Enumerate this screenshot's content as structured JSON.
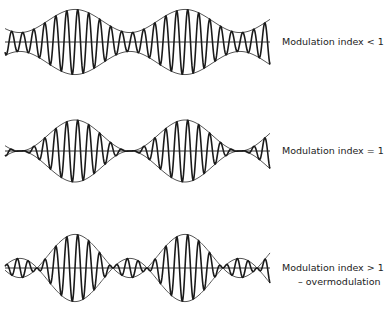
{
  "diagram": {
    "title": "",
    "panels": [
      {
        "id": "under",
        "label": "Modulation index < 1",
        "sublabel": "",
        "modulation_index": 0.55,
        "axis_y": 42,
        "amplitude": 21,
        "x_start": 5,
        "x_end": 270,
        "label_x": 282,
        "label_y": 36
      },
      {
        "id": "unity",
        "label": "Modulation index = 1",
        "sublabel": "",
        "modulation_index": 1.0,
        "axis_y": 151,
        "amplitude": 15.5,
        "x_start": 5,
        "x_end": 270,
        "label_x": 282,
        "label_y": 145
      },
      {
        "id": "over",
        "label": "Modulation index > 1",
        "sublabel": "– overmodulation",
        "modulation_index": 1.8,
        "axis_y": 268,
        "amplitude": 12,
        "x_start": 5,
        "x_end": 270,
        "label_x": 282,
        "label_y": 262
      }
    ],
    "carrier_cycles_per_period": 10,
    "envelope_period_px": 110,
    "envelope_phase_px": 20,
    "colors": {
      "line": "#1a1a1a",
      "envelope": "#555555",
      "axis": "#333333"
    }
  }
}
